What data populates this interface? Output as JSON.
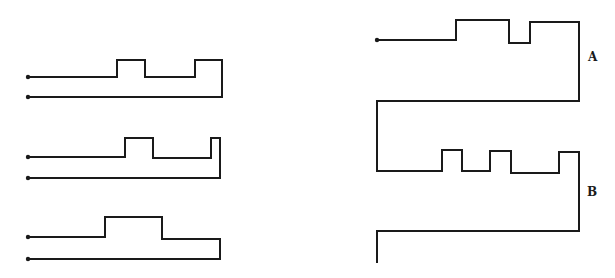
{
  "diagram": {
    "stroke_color": "#1a1a1a",
    "background": "#ffffff",
    "figures": [
      {
        "id": "left-1",
        "name": "key-profile-1",
        "points": "28,77 117,77 117,60 145,60 145,77 195,77 195,60 222,60 222,97 28,97",
        "dots": [
          [
            28,
            77
          ],
          [
            28,
            97
          ]
        ]
      },
      {
        "id": "left-2",
        "name": "key-profile-2",
        "points": "28,157 125,157 125,138 153,138 153,158 211,158 211,138 220,138 220,178 28,178",
        "dots": [
          [
            28,
            157
          ],
          [
            28,
            178
          ]
        ]
      },
      {
        "id": "left-3",
        "name": "key-profile-3",
        "points": "28,237 105,237 105,217 162,217 162,239 220,239 220,259 28,259",
        "dots": [
          [
            28,
            237
          ],
          [
            28,
            259
          ]
        ]
      },
      {
        "id": "right-A",
        "name": "key-profile-A",
        "points": "377,40 456,40 456,20 509,20 509,43 530,43 530,22 579,22 579,101 377,101 377,171",
        "dots": [
          [
            377,
            40
          ]
        ]
      },
      {
        "id": "right-B",
        "name": "key-profile-B",
        "points": "377,171 442,171 442,150 462,150 462,171 490,171 490,151 511,151 511,173 559,173 559,152 579,152 579,231 377,231 377,262",
        "dots": []
      }
    ],
    "labels": [
      {
        "id": "label-A",
        "text": "A",
        "x": 588,
        "y": 50
      },
      {
        "id": "label-B",
        "text": "B",
        "x": 587,
        "y": 185
      }
    ]
  }
}
